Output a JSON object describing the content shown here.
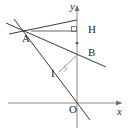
{
  "figure": {
    "kind": "geometry-diagram",
    "width": 132,
    "height": 133,
    "background_color": "#ffffff"
  },
  "axes": {
    "x_axis": {
      "label": "x",
      "name": "x-axis",
      "y": 103,
      "x_start": 8,
      "x_end": 122,
      "arrow": "right",
      "color": "#8a8a8a"
    },
    "y_axis": {
      "label": "y",
      "name": "y-axis",
      "x": 77,
      "y_start": 7,
      "y_end": 128,
      "arrow": "up",
      "color": "#8a8a8a"
    },
    "origin": {
      "label": "O",
      "x": 77,
      "y": 103
    }
  },
  "points": [
    {
      "id": "A",
      "label": "A",
      "x": 31,
      "y": 31,
      "label_x": 22,
      "label_y": 33
    },
    {
      "id": "H",
      "label": "H",
      "x": 77,
      "y": 31,
      "label_x": 88,
      "label_y": 24
    },
    {
      "id": "B",
      "label": "B",
      "x": 77,
      "y": 55,
      "label_x": 88,
      "label_y": 47
    },
    {
      "id": "I",
      "label": "I",
      "x": 62,
      "y": 69,
      "label_x": 51,
      "label_y": 68
    },
    {
      "id": "O",
      "label": "O",
      "x": 77,
      "y": 103,
      "label_x": 69,
      "label_y": 104
    }
  ],
  "segments": [
    {
      "id": "AH",
      "name": "segment-a-h",
      "from": "A",
      "to": "H",
      "x1": 31,
      "y1": 31,
      "x2": 77,
      "y2": 31,
      "color": "#9a9a9a",
      "width": 1.6
    },
    {
      "id": "AB-ray",
      "name": "line-a-through-b",
      "x1": 6,
      "y1": 23,
      "x2": 106,
      "y2": 67,
      "color": "#3a3a3a",
      "width": 1.1
    },
    {
      "id": "AO-ray",
      "name": "line-a-through-i-to-x-axis",
      "x1": 14,
      "y1": 19,
      "x2": 90,
      "y2": 120,
      "color": "#3a3a3a",
      "width": 1.1
    },
    {
      "id": "A-upper",
      "name": "line-through-a-upper-left",
      "x1": 9,
      "y1": 34,
      "x2": 77,
      "y2": 20,
      "color": "#3a3a3a",
      "width": 1.1
    },
    {
      "id": "BI",
      "name": "segment-b-i",
      "from": "B",
      "to": "I",
      "x1": 77,
      "y1": 55,
      "x2": 59,
      "y2": 72,
      "color": "#8a8a8a",
      "width": 1.0
    }
  ],
  "angle_marks": [
    {
      "id": "right-angle-H",
      "name": "right-angle-mark-h",
      "at": "H",
      "x": 77,
      "y": 31,
      "type": "square"
    },
    {
      "id": "right-angle-I",
      "name": "right-angle-mark-i",
      "at": "I",
      "x": 62,
      "y": 69,
      "type": "square"
    }
  ],
  "ticks": [
    {
      "id": "tick-HB",
      "name": "tick-mark-segment-hb",
      "x": 77,
      "y": 43
    }
  ],
  "colors": {
    "axis": "#8a8a8a",
    "line": "#3a3a3a",
    "accent_line": "#9a9a9a",
    "text": "#2b2b2b",
    "background": "#ffffff"
  }
}
